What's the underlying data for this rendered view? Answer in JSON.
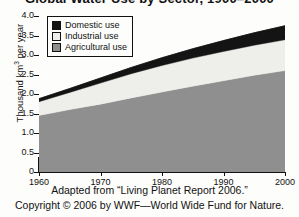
{
  "title": "Global Water Use by Sector, 1900–2000",
  "legend": {
    "position": "top-left-inside",
    "items": [
      {
        "label": "Domestic use",
        "color": "#141414",
        "name": "domestic"
      },
      {
        "label": "Industrial use",
        "color": "#eeeeea",
        "name": "industrial"
      },
      {
        "label": "Agricultural use",
        "color": "#8f8f8f",
        "name": "agricultural"
      }
    ]
  },
  "axes": {
    "ylabel_prefix": "Thousand km",
    "ylabel_sup": "3",
    "ylabel_suffix": " per year",
    "yticks": [
      "4.0",
      "3.5",
      "3.0",
      "2.5",
      "2.0",
      "1.5",
      "1.0",
      "0.5",
      "0"
    ],
    "xticks": [
      "1960",
      "1970",
      "1980",
      "1990",
      "2000"
    ]
  },
  "caption": {
    "line1": "Adapted from “Living Planet Report 2006.”",
    "line2": "Copyright © 2006 by WWF—World Wide Fund for Nature."
  },
  "chart_data": {
    "type": "area",
    "title": "Global Water Use by Sector, 1900–2000",
    "xlabel": "",
    "ylabel": "Thousand km³ per year",
    "xlim": [
      1960,
      2000
    ],
    "ylim": [
      0,
      4.0
    ],
    "ytick_values": [
      0,
      0.5,
      1.0,
      1.5,
      2.0,
      2.5,
      3.0,
      3.5,
      4.0
    ],
    "xtick_values": [
      1960,
      1970,
      1980,
      1990,
      2000
    ],
    "grid": false,
    "stacked": true,
    "x": [
      1960,
      1965,
      1970,
      1975,
      1980,
      1985,
      1990,
      1995,
      2000
    ],
    "series": [
      {
        "name": "Agricultural use",
        "color": "#8f8f8f",
        "values": [
          1.45,
          1.6,
          1.74,
          1.9,
          2.05,
          2.2,
          2.34,
          2.48,
          2.6
        ]
      },
      {
        "name": "Industrial use",
        "color": "#eeeeea",
        "values": [
          0.35,
          0.44,
          0.54,
          0.62,
          0.68,
          0.72,
          0.75,
          0.77,
          0.79
        ]
      },
      {
        "name": "Domestic use",
        "color": "#141414",
        "values": [
          0.08,
          0.1,
          0.13,
          0.16,
          0.2,
          0.24,
          0.28,
          0.32,
          0.36
        ]
      }
    ],
    "cumulative_totals": [
      1.88,
      2.14,
      2.41,
      2.68,
      2.93,
      3.16,
      3.37,
      3.57,
      3.75
    ]
  }
}
